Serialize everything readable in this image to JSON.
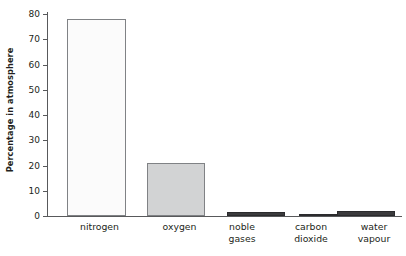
{
  "chart_data": {
    "type": "bar",
    "title": "",
    "xlabel": "",
    "ylabel": "Percentage in atmosphere",
    "categories": [
      "nitrogen",
      "oxygen",
      "noble gases",
      "carbon dioxide",
      "water vapour"
    ],
    "values": [
      78,
      21,
      1.5,
      0.4,
      2
    ],
    "ylim": [
      0,
      80
    ],
    "yticks": [
      0,
      10,
      20,
      30,
      40,
      50,
      60,
      70,
      80
    ],
    "ytick_labels": [
      "0",
      "10",
      "20",
      "30",
      "40",
      "50",
      "60",
      "70",
      "80"
    ],
    "grid": false,
    "legend": null,
    "bar_styles": [
      "light",
      "grey",
      "dark",
      "dark",
      "dark"
    ],
    "colors": {
      "bar_light_fill": "#fbfbfb",
      "bar_grey_fill": "#d2d3d4",
      "bar_dark_fill": "#3b3b3d",
      "bar_outline": "#808285",
      "axis": "#58595b",
      "text": "#231f20",
      "background": "#ffffff"
    }
  },
  "axis": {
    "y_title": "Percentage in atmosphere"
  },
  "labels": {
    "nitrogen": {
      "line1": "nitrogen",
      "line2": ""
    },
    "oxygen": {
      "line1": "oxygen",
      "line2": ""
    },
    "noble_gases": {
      "line1": "noble",
      "line2": "gases"
    },
    "carbon_dioxide": {
      "line1": "carbon",
      "line2": "dioxide"
    },
    "water_vapour": {
      "line1": "water",
      "line2": "vapour"
    }
  },
  "ticks": {
    "t0": "0",
    "t10": "10",
    "t20": "20",
    "t30": "30",
    "t40": "40",
    "t50": "50",
    "t60": "60",
    "t70": "70",
    "t80": "80"
  }
}
